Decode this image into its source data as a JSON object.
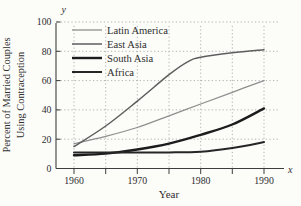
{
  "figure": {
    "background": "#fcfcf9",
    "axis_color": "#3d3d3d",
    "grid_color": "#a8a8a8",
    "text_color": "#2e2e2e"
  },
  "chart_data": {
    "type": "line",
    "title": "",
    "xlabel": "Year",
    "ylabel": "Percent of Married Couples Using Contraception",
    "ylabel_lines": [
      "Percent of Married Couples",
      "Using Contraception"
    ],
    "x_axis_end_label": "x",
    "y_axis_end_label": "y",
    "xlim": [
      1957,
      1993
    ],
    "ylim": [
      0,
      100
    ],
    "x_ticks": [
      1960,
      1965,
      1970,
      1975,
      1980,
      1985,
      1990
    ],
    "x_labeled_ticks": [
      1960,
      1970,
      1980,
      1990
    ],
    "x_tick_labels": [
      "1960",
      "1970",
      "1980",
      "1990"
    ],
    "y_ticks": [
      0,
      20,
      40,
      60,
      80,
      100
    ],
    "y_tick_labels": [
      "0",
      "20",
      "40",
      "60",
      "80",
      "100"
    ],
    "grid": "dotted",
    "grid_vertical_years": [
      1960,
      1965,
      1970,
      1975,
      1980,
      1985,
      1990
    ],
    "grid_horizontal_values": [
      20,
      40,
      60,
      80,
      100
    ],
    "legend_position": "top-left-inside",
    "series": [
      {
        "name": "Latin America",
        "color": "#8f8f8f",
        "width": 1.3,
        "x": [
          1960,
          1965,
          1970,
          1975,
          1980,
          1985,
          1990
        ],
        "values": [
          17,
          22,
          28,
          36,
          44,
          52,
          60
        ]
      },
      {
        "name": "East Asia",
        "color": "#5e5e5e",
        "width": 1.5,
        "x": [
          1960,
          1965,
          1970,
          1975,
          1978,
          1980,
          1985,
          1990
        ],
        "values": [
          15,
          29,
          46,
          64,
          73,
          76,
          79,
          81
        ]
      },
      {
        "name": "South Asia",
        "color": "#1c1c1c",
        "width": 2.4,
        "x": [
          1960,
          1965,
          1970,
          1975,
          1980,
          1985,
          1990
        ],
        "values": [
          9,
          10.2,
          13,
          17,
          23,
          30,
          41
        ]
      },
      {
        "name": "Africa",
        "color": "#262626",
        "width": 2.0,
        "x": [
          1960,
          1965,
          1970,
          1975,
          1980,
          1985,
          1990
        ],
        "values": [
          11,
          11,
          11,
          11,
          11.5,
          14,
          18
        ]
      }
    ]
  }
}
